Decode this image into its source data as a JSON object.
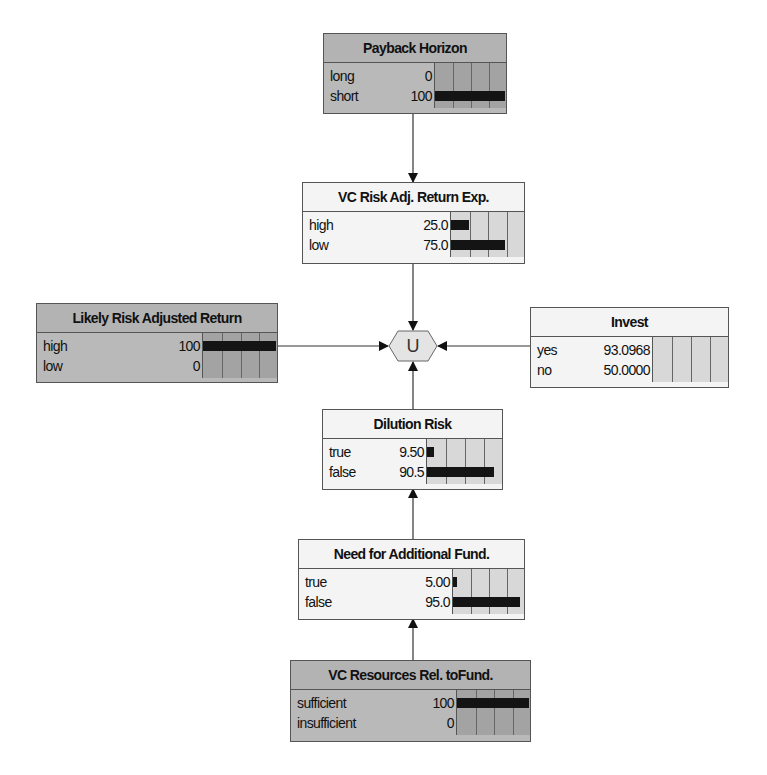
{
  "diagram": {
    "type": "influence-diagram",
    "nodes": {
      "payback": {
        "title": "Payback Horizon",
        "evidence": true,
        "states": [
          {
            "name": "long",
            "value": "0",
            "pct": 0
          },
          {
            "name": "short",
            "value": "100",
            "pct": 100
          }
        ]
      },
      "vc_risk": {
        "title": "VC Risk Adj. Return Exp.",
        "evidence": false,
        "states": [
          {
            "name": "high",
            "value": "25.0",
            "pct": 25
          },
          {
            "name": "low",
            "value": "75.0",
            "pct": 75
          }
        ]
      },
      "likely": {
        "title": "Likely Risk Adjusted Return",
        "evidence": true,
        "states": [
          {
            "name": "high",
            "value": "100",
            "pct": 100
          },
          {
            "name": "low",
            "value": "0",
            "pct": 0
          }
        ]
      },
      "invest": {
        "title": "Invest",
        "evidence": false,
        "states": [
          {
            "name": "yes",
            "value": "93.0968",
            "pct": 0
          },
          {
            "name": "no",
            "value": "50.0000",
            "pct": 0
          }
        ]
      },
      "dilution": {
        "title": "Dilution Risk",
        "evidence": false,
        "states": [
          {
            "name": "true",
            "value": "9.50",
            "pct": 9.5
          },
          {
            "name": "false",
            "value": "90.5",
            "pct": 90.5
          }
        ]
      },
      "need_fund": {
        "title": "Need for Additional Fund.",
        "evidence": false,
        "states": [
          {
            "name": "true",
            "value": "5.00",
            "pct": 5
          },
          {
            "name": "false",
            "value": "95.0",
            "pct": 95
          }
        ]
      },
      "vc_resources": {
        "title": "VC Resources Rel. toFund.",
        "evidence": true,
        "states": [
          {
            "name": "sufficient",
            "value": "100",
            "pct": 100
          },
          {
            "name": "insufficient",
            "value": "0",
            "pct": 0
          }
        ]
      }
    },
    "utility": {
      "label": "U"
    },
    "edges": [
      {
        "from": "Payback Horizon",
        "to": "VC Risk Adj. Return Exp."
      },
      {
        "from": "VC Risk Adj. Return Exp.",
        "to": "U"
      },
      {
        "from": "Likely Risk Adjusted Return",
        "to": "U"
      },
      {
        "from": "Invest",
        "to": "U"
      },
      {
        "from": "Dilution Risk",
        "to": "U"
      },
      {
        "from": "Need for Additional Fund.",
        "to": "Dilution Risk"
      },
      {
        "from": "VC Resources Rel. toFund.",
        "to": "Need for Additional Fund."
      }
    ],
    "colors": {
      "evidence_node_bg": "#b9b9b9",
      "normal_node_bg": "#f4f4f4",
      "bar": "#141414",
      "utility_fill": "#e4e4e4"
    }
  }
}
